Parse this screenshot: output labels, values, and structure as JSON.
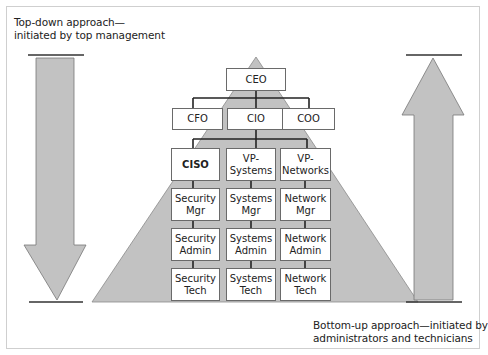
{
  "captions": {
    "top_down": "Top-down approach—\ninitiated by top management",
    "bottom_up": "Bottom-up approach—initiated by\nadministrators and technicians"
  },
  "org": {
    "ceo": "CEO",
    "level2": [
      "CFO",
      "CIO",
      "COO"
    ],
    "columns": [
      {
        "head": "CISO",
        "mgr": "Security\nMgr",
        "admin": "Security\nAdmin",
        "tech": "Security\nTech"
      },
      {
        "head": "VP-\nSystems",
        "mgr": "Systems\nMgr",
        "admin": "Systems\nAdmin",
        "tech": "Systems\nTech"
      },
      {
        "head": "VP-\nNetworks",
        "mgr": "Network\nMgr",
        "admin": "Network\nAdmin",
        "tech": "Network\nTech"
      }
    ]
  },
  "colors": {
    "fill": "#c2c2c2",
    "line": "#333333",
    "box_border": "#6a6a6a"
  }
}
